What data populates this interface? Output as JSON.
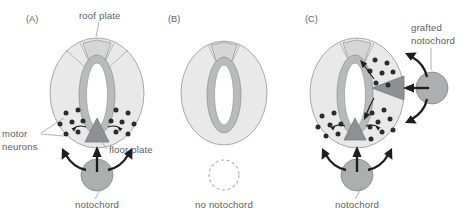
{
  "figure": {
    "background_color": "#ffffff",
    "label_color": "#5d5f63"
  },
  "colors": {
    "neural_tube_body": "#e9e9e9",
    "lumen_ring": "#b9babb",
    "lumen": "#ffffff",
    "roof_plate": "#d6d6d6",
    "floor_plate": "#8e9092",
    "notochord": "#acaeb0",
    "motor_neuron_dot": "#2c2c2c",
    "outline": "#9fa0a2",
    "arrow": "#1d1d1d"
  },
  "panels": [
    {
      "id": "A",
      "letter": "(A)",
      "condition": "normal",
      "labels": {
        "roof_plate": "roof plate",
        "motor_neurons": "motor\nneurons",
        "motor_neurons_line1": "motor",
        "motor_neurons_line2": "neurons",
        "floor_plate": "floor plate",
        "notochord": "notochord"
      },
      "features": {
        "has_roof_plate": true,
        "has_floor_plate": true,
        "has_notochord": true,
        "has_grafted_notochord": false,
        "motor_neuron_count": 14,
        "notochord_arrows": 3
      }
    },
    {
      "id": "B",
      "letter": "(B)",
      "condition": "notochord removed",
      "labels": {
        "no_notochord": "no notochord"
      },
      "features": {
        "has_roof_plate": true,
        "has_floor_plate": false,
        "has_notochord": false,
        "has_grafted_notochord": false,
        "motor_neuron_count": 0,
        "notochord_arrows": 0
      }
    },
    {
      "id": "C",
      "letter": "(C)",
      "condition": "notochord grafted laterally",
      "labels": {
        "grafted_notochord": "grafted\nnotochord",
        "grafted_notochord_line1": "grafted",
        "grafted_notochord_line2": "notochord",
        "notochord": "notochord"
      },
      "features": {
        "has_roof_plate": true,
        "has_floor_plate": true,
        "has_ectopic_floor_plate": true,
        "has_notochord": true,
        "has_grafted_notochord": true,
        "motor_neuron_count": 27,
        "notochord_arrows": 3,
        "grafted_notochord_arrows": 3
      }
    }
  ]
}
